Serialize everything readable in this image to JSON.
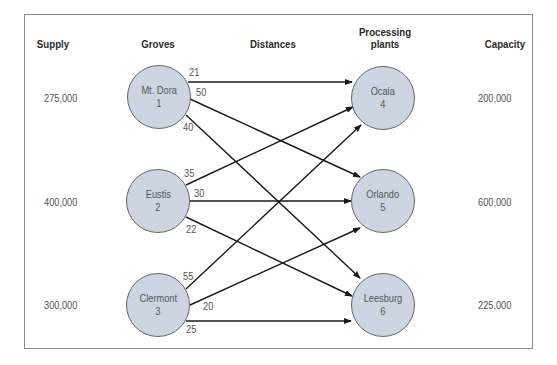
{
  "headers": {
    "supply": "Supply",
    "groves": "Groves",
    "distances": "Distances",
    "plants": "Processing plants",
    "plants_line1": "Processing",
    "plants_line2": "plants",
    "capacity": "Capacity"
  },
  "groves": [
    {
      "name": "Mt. Dora",
      "id": "1",
      "supply": "275,000"
    },
    {
      "name": "Eustis",
      "id": "2",
      "supply": "400,000"
    },
    {
      "name": "Clermont",
      "id": "3",
      "supply": "300,000"
    }
  ],
  "plants": [
    {
      "name": "Ocala",
      "id": "4",
      "capacity": "200,000"
    },
    {
      "name": "Orlando",
      "id": "5",
      "capacity": "600,000"
    },
    {
      "name": "Leesburg",
      "id": "6",
      "capacity": "225,000"
    }
  ],
  "distances": {
    "1_4": "21",
    "1_5": "50",
    "1_6": "40",
    "2_4": "35",
    "2_5": "30",
    "2_6": "22",
    "3_4": "55",
    "3_5": "20",
    "3_6": "25"
  },
  "colors": {
    "node_fill": "#ccd5e1",
    "node_border": "#666666",
    "edge": "#1a1a1a",
    "frame": "#8a8a8a"
  }
}
